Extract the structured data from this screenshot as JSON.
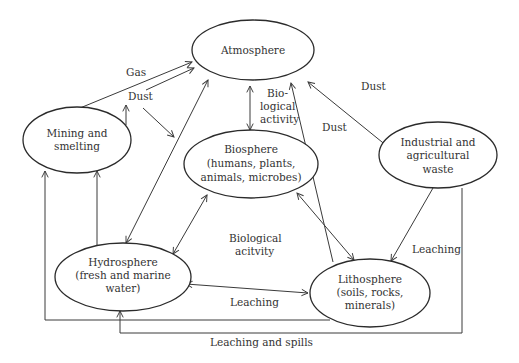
{
  "diagram": {
    "type": "flow diagram",
    "nodes": {
      "atmosphere": {
        "lines": [
          "Atmosphere"
        ]
      },
      "mining": {
        "lines": [
          "Mining and",
          "smelting"
        ]
      },
      "biosphere": {
        "lines": [
          "Biosphere",
          "(humans, plants,",
          "animals, microbes)"
        ]
      },
      "industrial": {
        "lines": [
          "Industrial and",
          "agricultural",
          "waste"
        ]
      },
      "hydrosphere": {
        "lines": [
          "Hydrosphere",
          "(fresh and marine",
          "water)"
        ]
      },
      "lithosphere": {
        "lines": [
          "Lithosphere",
          "(soils, rocks,",
          "minerals)"
        ]
      }
    },
    "edge_labels": {
      "gas": "Gas",
      "dust_mining": "Dust",
      "bio_activity_top": [
        "Bio-",
        "logical",
        "activity"
      ],
      "dust_center": "Dust",
      "dust_industrial": "Dust",
      "bio_activity_bottom": [
        "Biological",
        "acitvity"
      ],
      "leaching_right": "Leaching",
      "leaching_bottom": "Leaching",
      "leaching_spills": "Leaching and spills"
    },
    "edges": [
      {
        "from": "mining",
        "to": "atmosphere",
        "label": "Gas"
      },
      {
        "from": "mining",
        "to": "atmosphere",
        "label": "Dust"
      },
      {
        "from": "atmosphere",
        "to": "biosphere",
        "label": "Biological activity",
        "bidirectional": true
      },
      {
        "from": "hydrosphere",
        "to": "atmosphere",
        "bidirectional": true
      },
      {
        "from": "lithosphere",
        "to": "atmosphere",
        "label": "Dust"
      },
      {
        "from": "industrial",
        "to": "atmosphere",
        "label": "Dust"
      },
      {
        "from": "biosphere",
        "to": "hydrosphere",
        "label": "Biological acitvity",
        "bidirectional": true
      },
      {
        "from": "biosphere",
        "to": "lithosphere",
        "bidirectional": true
      },
      {
        "from": "industrial",
        "to": "lithosphere",
        "label": "Leaching"
      },
      {
        "from": "hydrosphere",
        "to": "lithosphere",
        "label": "Leaching",
        "bidirectional": true
      },
      {
        "from": "hydrosphere",
        "to": "mining"
      },
      {
        "from": "lithosphere",
        "to": "mining"
      },
      {
        "from": "industrial",
        "to": "hydrosphere",
        "label": "Leaching and spills"
      }
    ]
  }
}
